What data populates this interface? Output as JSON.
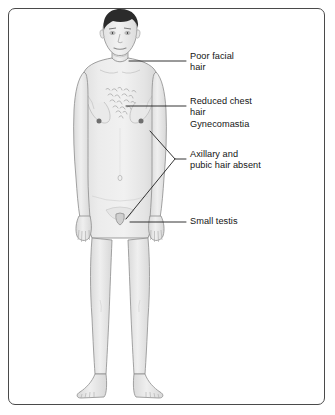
{
  "figure": {
    "border_color": "#4a4a4a",
    "background": "#ffffff"
  },
  "subject": {
    "name": "adult-male-figure",
    "view": "anterior full body standing",
    "skin_color": "#e9e9e9",
    "outline_color": "#8d8d8d",
    "hair_color": "#2b2b2b",
    "nipple_color": "#6f6f6f",
    "chest_hair_color": "#9a9a9a"
  },
  "leader_lines": {
    "color": "#1e1e1e",
    "width": 0.9
  },
  "labels": [
    {
      "id": "poor-facial-hair",
      "lines": [
        "Poor facial",
        "hair"
      ],
      "text": "Poor facial\nhair",
      "points_to": "face / jaw"
    },
    {
      "id": "reduced-chest-hair-gynecomastia",
      "lines": [
        "Reduced chest",
        "hair",
        "Gynecomastia"
      ],
      "text": "Reduced chest\nhair\nGynecomastia",
      "points_to": "chest"
    },
    {
      "id": "axillary-pubic-hair-absent",
      "lines": [
        "Axillary and",
        "pubic hair absent"
      ],
      "text": "Axillary and\npubic hair absent",
      "points_to": "axilla and pubis"
    },
    {
      "id": "small-testis",
      "lines": [
        "Small testis"
      ],
      "text": "Small testis",
      "points_to": "scrotum"
    }
  ]
}
